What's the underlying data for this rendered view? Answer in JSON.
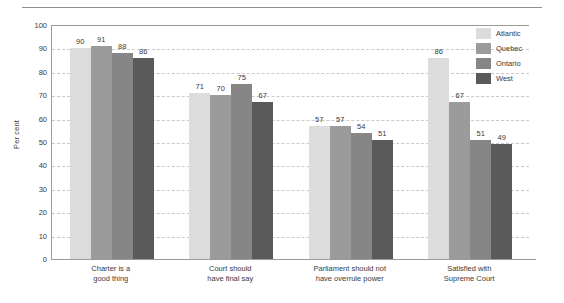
{
  "chart_data": {
    "type": "bar",
    "title": "",
    "subtitle": "",
    "xlabel": "",
    "ylabel": "Per cent",
    "ylim": [
      0,
      100
    ],
    "ytick_step": 10,
    "yticks": [
      100,
      90,
      80,
      70,
      60,
      50,
      40,
      30,
      20,
      10,
      0
    ],
    "grid": true,
    "grid_style": "dashed-horizontal",
    "legend_position": "top-right",
    "categories": [
      "Charter is a\ngood thing",
      "Court should\nhave final say",
      "Parliament should not\nhave overrule power",
      "Satisfied with\nSupreme Court"
    ],
    "series": [
      {
        "name": "Atlantic",
        "color": "#dcdcdc",
        "values": [
          90,
          71,
          57,
          86
        ]
      },
      {
        "name": "Quebec",
        "color": "#9b9b9b",
        "values": [
          91,
          70,
          57,
          67
        ]
      },
      {
        "name": "Ontario",
        "color": "#868686",
        "values": [
          88,
          75,
          54,
          51
        ]
      },
      {
        "name": "West",
        "color": "#5a5a5a",
        "values": [
          86,
          67,
          51,
          49
        ]
      }
    ]
  }
}
